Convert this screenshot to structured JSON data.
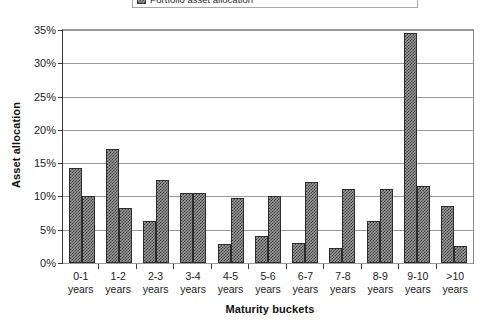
{
  "legend": {
    "entries": [
      {
        "label": "Portfolio asset allocation",
        "swatch": "hatched-gray"
      }
    ]
  },
  "axes": {
    "y_title": "Asset allocation",
    "x_title": "Maturity buckets",
    "y_ticks": [
      "0%",
      "5%",
      "10%",
      "15%",
      "20%",
      "25%",
      "30%",
      "35%"
    ]
  },
  "chart_data": {
    "type": "bar",
    "title": "",
    "subtitle": "",
    "xlabel": "Maturity buckets",
    "ylabel": "Asset allocation",
    "ylim": [
      0,
      35
    ],
    "ytick_values": [
      0,
      5,
      10,
      15,
      20,
      25,
      30,
      35
    ],
    "ytick_labels": [
      "0%",
      "5%",
      "10%",
      "15%",
      "20%",
      "25%",
      "30%",
      "35%"
    ],
    "grid": true,
    "legend_position": "top-center",
    "categories": [
      "0-1 years",
      "1-2 years",
      "2-3 years",
      "3-4 years",
      "4-5 years",
      "5-6 years",
      "6-7 years",
      "7-8 years",
      "8-9 years",
      "9-10 years",
      ">10 years"
    ],
    "category_lines": [
      [
        "0-1",
        "years"
      ],
      [
        "1-2",
        "years"
      ],
      [
        "2-3",
        "years"
      ],
      [
        "3-4",
        "years"
      ],
      [
        "4-5",
        "years"
      ],
      [
        "5-6",
        "years"
      ],
      [
        "6-7",
        "years"
      ],
      [
        "7-8",
        "years"
      ],
      [
        "8-9",
        "years"
      ],
      [
        "9-10",
        "years"
      ],
      [
        ">10",
        "years"
      ]
    ],
    "series": [
      {
        "name": "Portfolio asset allocation",
        "values": [
          14.2,
          17.2,
          6.3,
          10.5,
          2.8,
          4.0,
          3.0,
          2.2,
          6.3,
          34.5,
          8.5
        ]
      },
      {
        "name": "Benchmark asset allocation",
        "values": [
          10.1,
          8.3,
          12.5,
          10.5,
          9.7,
          10.0,
          12.1,
          11.1,
          11.1,
          11.6,
          2.5
        ]
      }
    ]
  }
}
